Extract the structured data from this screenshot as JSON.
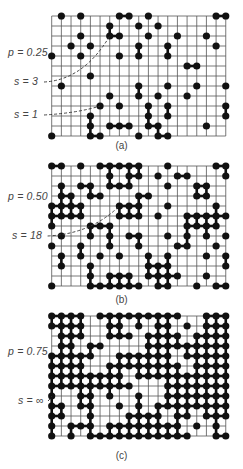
{
  "figure": {
    "grid": {
      "cols": 19,
      "rows": 13,
      "x0": 51.7,
      "dx": 9.67,
      "dy": 10.0,
      "line_color": "#555555",
      "site_color": "#111111",
      "bond_color": "#111111"
    },
    "panels": [
      {
        "id": "a",
        "caption": "(a)",
        "p_label": "p = 0.25",
        "top": 16,
        "annotations": [
          {
            "label": "s = 3",
            "label_x": 14,
            "label_y": 75,
            "path_to": [
              6,
              2
            ]
          },
          {
            "label": "s = 1",
            "label_x": 14,
            "label_y": 108,
            "path_to": [
              5,
              9
            ]
          }
        ],
        "caption_y": 140,
        "p_label_y": 46,
        "occupied_rows": [
          [
            1,
            3,
            7,
            8,
            10,
            17,
            18
          ],
          [
            6,
            9,
            11
          ],
          [
            3,
            6,
            7,
            10,
            13,
            16
          ],
          [
            2,
            4,
            9,
            12,
            17
          ],
          [
            0,
            3,
            7,
            9,
            12
          ],
          [
            14,
            15
          ],
          [
            4
          ],
          [
            1,
            9,
            12,
            15,
            18
          ],
          [
            6,
            9,
            11,
            14
          ],
          [
            5,
            7,
            10,
            12,
            18
          ],
          [
            4,
            10,
            12,
            18
          ],
          [
            4,
            6,
            7,
            8,
            10,
            11,
            16
          ],
          [
            0,
            4,
            5,
            9,
            11,
            12
          ]
        ]
      },
      {
        "id": "b",
        "caption": "(b)",
        "p_label": "p = 0.50",
        "top": 166,
        "annotations": [
          {
            "label": "s = 18",
            "label_x": 12,
            "label_y": 229,
            "path_to": [
              7,
              4
            ]
          }
        ],
        "caption_y": 294,
        "p_label_y": 190,
        "occupied_rows": [
          [
            0,
            1,
            3,
            5,
            6,
            7,
            8,
            9,
            12,
            17,
            18
          ],
          [
            6,
            8,
            9,
            11,
            13,
            14,
            18
          ],
          [
            1,
            3,
            4,
            6,
            7,
            8,
            12,
            15,
            16
          ],
          [
            1,
            2,
            4,
            5,
            9,
            10,
            15,
            16
          ],
          [
            0,
            1,
            2,
            3,
            7,
            8,
            9,
            12,
            17
          ],
          [
            0,
            1,
            2,
            3,
            7,
            8,
            9,
            11,
            14,
            15,
            16,
            17,
            18
          ],
          [
            0,
            4,
            5,
            6,
            14,
            15,
            16,
            17
          ],
          [
            1,
            4,
            6,
            8,
            9,
            12,
            14,
            16,
            18
          ],
          [
            0,
            3,
            6,
            9,
            13,
            14,
            17
          ],
          [
            1,
            3,
            5,
            7,
            10,
            12,
            16,
            18
          ],
          [
            1,
            4,
            10,
            11,
            12,
            18
          ],
          [
            4,
            6,
            7,
            8,
            10,
            11,
            12,
            13,
            16
          ],
          [
            0,
            4,
            5,
            6,
            7,
            8,
            9,
            11,
            12,
            15,
            17,
            18
          ]
        ]
      },
      {
        "id": "c",
        "caption": "(c)",
        "p_label": "p = 0.75",
        "top": 316,
        "annotations": [
          {
            "label": "s = ∞",
            "label_x": 18,
            "label_y": 394,
            "path_to": [
              0,
              8
            ]
          }
        ],
        "caption_y": 450,
        "p_label_y": 345,
        "occupied_rows": [
          [
            0,
            1,
            2,
            3,
            5,
            6,
            7,
            8,
            9,
            10,
            11,
            12,
            13,
            16,
            17,
            18
          ],
          [
            0,
            1,
            2,
            3,
            6,
            7,
            9,
            11,
            12,
            14,
            16,
            17,
            18
          ],
          [
            1,
            2,
            3,
            6,
            7,
            8,
            10,
            11,
            12,
            13,
            15,
            16,
            17,
            18
          ],
          [
            1,
            2,
            4,
            5,
            10,
            11,
            12,
            13,
            14,
            15,
            16,
            17,
            18
          ],
          [
            0,
            1,
            2,
            3,
            4,
            7,
            8,
            9,
            10,
            11,
            12,
            14,
            15,
            16,
            17,
            18
          ],
          [
            0,
            1,
            2,
            3,
            6,
            7,
            8,
            9,
            10,
            11,
            12,
            13,
            15,
            16,
            17,
            18
          ],
          [
            0,
            1,
            2,
            3,
            4,
            5,
            6,
            7,
            9,
            10,
            11,
            12,
            13,
            14,
            15,
            16,
            17,
            18
          ],
          [
            0,
            1,
            2,
            3,
            4,
            5,
            6,
            7,
            8,
            12,
            13,
            14,
            15,
            16,
            17,
            18
          ],
          [
            0,
            3,
            4,
            6,
            9,
            12,
            13,
            14,
            15,
            16,
            17,
            18
          ],
          [
            0,
            1,
            3,
            4,
            7,
            9,
            11,
            12,
            13,
            14,
            15,
            16,
            17,
            18
          ],
          [
            0,
            1,
            4,
            8,
            9,
            10,
            11,
            13,
            14,
            16,
            17,
            18
          ],
          [
            0,
            2,
            3,
            4,
            6,
            7,
            8,
            9,
            10,
            11,
            12,
            13,
            15,
            17
          ],
          [
            0,
            2,
            4,
            5,
            6,
            7,
            8,
            9,
            10,
            11,
            12,
            13,
            14,
            17,
            18
          ]
        ]
      }
    ]
  }
}
